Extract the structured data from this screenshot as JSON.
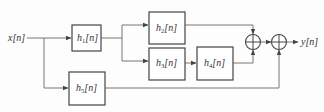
{
  "diagram": {
    "input_label": "x[n]",
    "output_label": "y[n]",
    "blocks": [
      {
        "id": "h1",
        "base": "h",
        "sub": "1",
        "arg": "[n]"
      },
      {
        "id": "h2",
        "base": "h",
        "sub": "2",
        "arg": "[n]"
      },
      {
        "id": "h3",
        "base": "h",
        "sub": "3",
        "arg": "[n]"
      },
      {
        "id": "h4",
        "base": "h",
        "sub": "4",
        "arg": "[n]"
      },
      {
        "id": "h5",
        "base": "h",
        "sub": "5",
        "arg": "[n]"
      }
    ],
    "adders": [
      {
        "id": "sum1",
        "inputs": [
          "h2",
          "h4"
        ]
      },
      {
        "id": "sum2",
        "inputs": [
          "sum1",
          "h5"
        ]
      }
    ],
    "connections": [
      [
        "x",
        "h1"
      ],
      [
        "x",
        "h5"
      ],
      [
        "h1",
        "h2"
      ],
      [
        "h1",
        "h3"
      ],
      [
        "h3",
        "h4"
      ],
      [
        "h2",
        "sum1"
      ],
      [
        "h4",
        "sum1"
      ],
      [
        "sum1",
        "sum2"
      ],
      [
        "h5",
        "sum2"
      ],
      [
        "sum2",
        "y"
      ]
    ]
  }
}
